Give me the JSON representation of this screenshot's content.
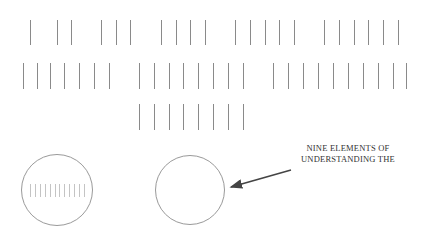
{
  "diagram": {
    "colors": {
      "tick": "#8a8a8a",
      "mini_tick": "#c4c4c4",
      "circle": "#9a9a9a",
      "arrow": "#444444",
      "text": "#333333",
      "background": "#ffffff"
    },
    "tick_rows": [
      {
        "y": 20,
        "height": 25,
        "groups": [
          {
            "count": 1,
            "x": [
              30
            ]
          },
          {
            "count": 2,
            "x": [
              57,
              71
            ]
          },
          {
            "count": 3,
            "x": [
              101,
              116,
              130
            ]
          },
          {
            "count": 4,
            "x": [
              161,
              176,
              190,
              205
            ]
          },
          {
            "count": 5,
            "x": [
              235,
              250,
              265,
              279,
              294
            ]
          },
          {
            "count": 6,
            "x": [
              324,
              339,
              354,
              368,
              383,
              398
            ]
          }
        ]
      },
      {
        "y": 63,
        "height": 26,
        "groups": [
          {
            "count": 7,
            "x": [
              23,
              37,
              50,
              64,
              79,
              94,
              109
            ]
          },
          {
            "count": 8,
            "x": [
              139,
              154,
              169,
              183,
              198,
              213,
              228,
              243
            ]
          },
          {
            "count": 10,
            "x": [
              273,
              288,
              303,
              318,
              333,
              348,
              363,
              378,
              393,
              406
            ]
          }
        ]
      },
      {
        "y": 104,
        "height": 26,
        "groups": [
          {
            "count": 8,
            "x": [
              139,
              154,
              169,
              183,
              198,
              213,
              228,
              243
            ]
          }
        ]
      }
    ],
    "circles": [
      {
        "name": "left-circle",
        "cx": 57,
        "cy": 190,
        "r": 36,
        "inner_ticks": 12
      },
      {
        "name": "right-circle",
        "cx": 190,
        "cy": 190,
        "r": 35,
        "inner_ticks": 0
      }
    ],
    "arrow": {
      "from": [
        291,
        170
      ],
      "to": [
        231,
        187
      ]
    },
    "label": {
      "lines": [
        "NINE ELEMENTS OF",
        "UNDERSTANDING THE"
      ],
      "line1": "NINE ELEMENTS OF",
      "line2": "UNDERSTANDING THE"
    }
  }
}
